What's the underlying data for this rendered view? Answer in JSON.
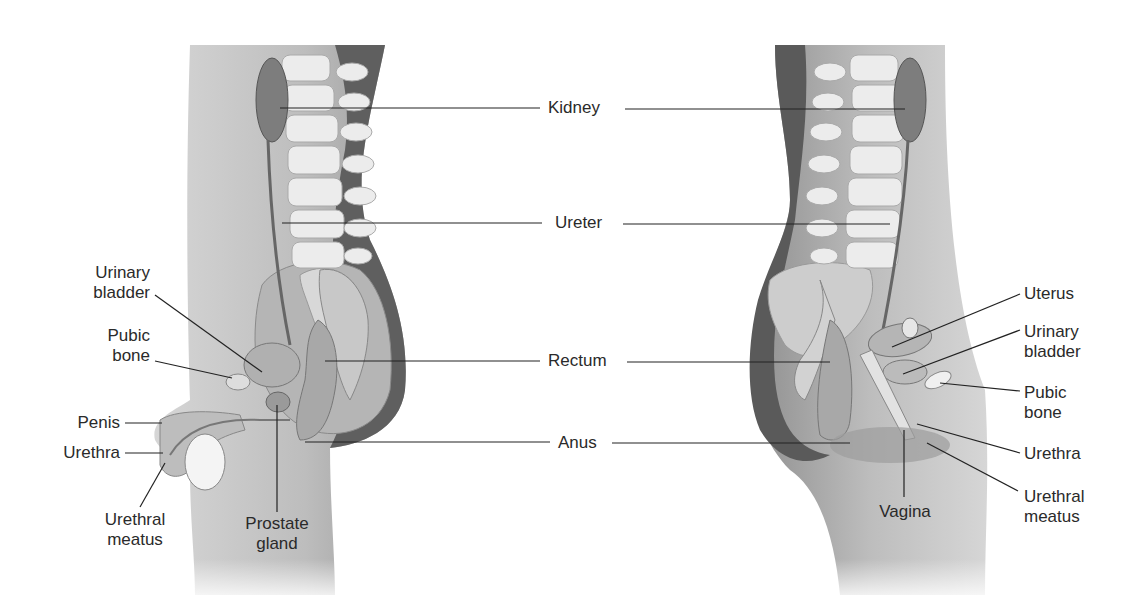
{
  "figure": {
    "center_labels": [
      "Kidney",
      "Ureter",
      "Rectum",
      "Anus"
    ],
    "male_labels": {
      "urinary_bladder": "Urinary\nbladder",
      "pubic_bone": "Pubic\nbone",
      "penis": "Penis",
      "urethra": "Urethra",
      "urethral_meatus": "Urethral\nmeatus",
      "prostate_gland": "Prostate\ngland"
    },
    "female_labels": {
      "uterus": "Uterus",
      "urinary_bladder": "Urinary\nbladder",
      "pubic_bone": "Pubic\nbone",
      "urethra": "Urethra",
      "urethral_meatus": "Urethral\nmeatus",
      "vagina": "Vagina"
    },
    "colors": {
      "body": "#c9c9c9",
      "body_dark": "#5a5a5a",
      "bone": "#ececec",
      "organ": "#a8a8a8",
      "kidney": "#7d7d7d",
      "line": "#222222"
    }
  }
}
